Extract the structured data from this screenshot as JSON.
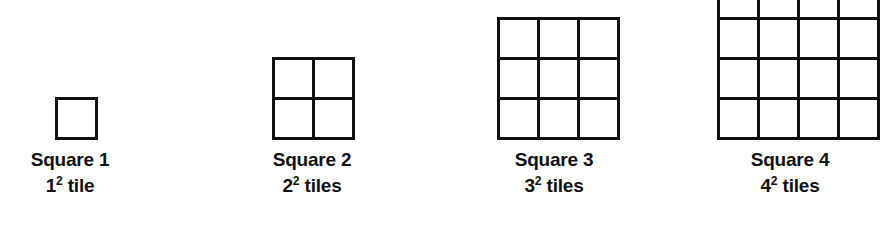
{
  "figure": {
    "type": "square-number-diagram",
    "background_color": "#ffffff",
    "line_color": "#111111",
    "text_color": "#111111",
    "line_width_px": 3,
    "baseline_y_px": 140,
    "groups": [
      {
        "id": "square-1",
        "side_tiles": 1,
        "tile_count": 1,
        "cell_px": 37,
        "left_px": 55,
        "width_px": 37,
        "label_center_px": 70,
        "clipped_top": false,
        "title": "Square 1",
        "count_base": "1",
        "count_exponent": "2",
        "count_unit": "tile",
        "count_text": "1² tile"
      },
      {
        "id": "square-2",
        "side_tiles": 2,
        "tile_count": 4,
        "cell_px": 37,
        "left_px": 272,
        "width_px": 77,
        "label_center_px": 312,
        "clipped_top": false,
        "title": "Square 2",
        "count_base": "2",
        "count_exponent": "2",
        "count_unit": "tiles",
        "count_text": "2² tiles"
      },
      {
        "id": "square-3",
        "side_tiles": 3,
        "tile_count": 9,
        "cell_px": 37,
        "left_px": 497,
        "width_px": 117,
        "label_center_px": 554,
        "clipped_top": false,
        "title": "Square 3",
        "count_base": "3",
        "count_exponent": "2",
        "count_unit": "tiles",
        "count_text": "3² tiles"
      },
      {
        "id": "square-4",
        "side_tiles": 4,
        "tile_count": 16,
        "cell_px": 37,
        "left_px": 717,
        "width_px": 157,
        "label_center_px": 790,
        "clipped_top": true,
        "title": "Square 4",
        "count_base": "4",
        "count_exponent": "2",
        "count_unit": "tiles",
        "count_text": "4² tiles"
      }
    ]
  }
}
